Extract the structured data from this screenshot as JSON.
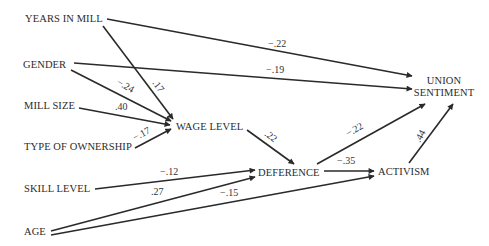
{
  "diagram": {
    "type": "path-diagram",
    "nodes": {
      "years_in_mill": "YEARS IN MILL",
      "gender": "GENDER",
      "mill_size": "MILL SIZE",
      "type_of_ownership": "TYPE OF OWNERSHIP",
      "skill_level": "SKILL LEVEL",
      "age": "AGE",
      "wage_level": "WAGE LEVEL",
      "deference": "DEFERENCE",
      "activism": "ACTIVISM",
      "union_sentiment_line1": "UNION",
      "union_sentiment_line2": "SENTIMENT"
    },
    "edges": [
      {
        "from": "YEARS IN MILL",
        "to": "UNION SENTIMENT",
        "coef": "−.22"
      },
      {
        "from": "YEARS IN MILL",
        "to": "WAGE LEVEL",
        "coef": ".17"
      },
      {
        "from": "GENDER",
        "to": "UNION SENTIMENT",
        "coef": "−.19"
      },
      {
        "from": "GENDER",
        "to": "WAGE LEVEL",
        "coef": "−.24"
      },
      {
        "from": "MILL SIZE",
        "to": "WAGE LEVEL",
        "coef": ".40"
      },
      {
        "from": "TYPE OF OWNERSHIP",
        "to": "WAGE LEVEL",
        "coef": "−.17"
      },
      {
        "from": "WAGE LEVEL",
        "to": "DEFERENCE",
        "coef": ".22"
      },
      {
        "from": "SKILL LEVEL",
        "to": "DEFERENCE",
        "coef": "−.12"
      },
      {
        "from": "AGE",
        "to": "DEFERENCE",
        "coef": ".27"
      },
      {
        "from": "AGE",
        "to": "ACTIVISM",
        "coef": "−.15"
      },
      {
        "from": "DEFERENCE",
        "to": "UNION SENTIMENT",
        "coef": "−.22"
      },
      {
        "from": "DEFERENCE",
        "to": "ACTIVISM",
        "coef": "−.35"
      },
      {
        "from": "ACTIVISM",
        "to": "UNION SENTIMENT",
        "coef": ".44"
      }
    ]
  }
}
